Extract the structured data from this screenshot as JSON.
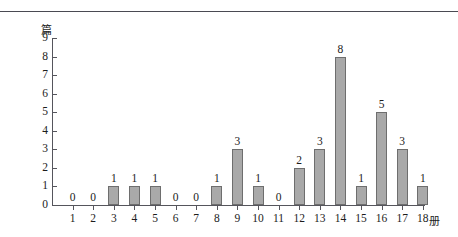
{
  "figure": {
    "top_rule": true,
    "y_unit": "篇",
    "x_unit": "册"
  },
  "chart_data": {
    "type": "bar",
    "title": "",
    "subtitle": "",
    "xlabel": "册",
    "ylabel": "篇",
    "categories": [
      "1",
      "2",
      "3",
      "4",
      "5",
      "6",
      "7",
      "8",
      "9",
      "10",
      "11",
      "12",
      "13",
      "14",
      "15",
      "16",
      "17",
      "18"
    ],
    "values": [
      0,
      0,
      1,
      1,
      1,
      0,
      0,
      1,
      3,
      1,
      0,
      2,
      3,
      8,
      1,
      5,
      3,
      1
    ],
    "data_labels": [
      "0",
      "0",
      "1",
      "1",
      "1",
      "0",
      "0",
      "1",
      "3",
      "1",
      "0",
      "2",
      "3",
      "8",
      "1",
      "5",
      "3",
      "1"
    ],
    "ylim": [
      0,
      9
    ],
    "y_ticks": [
      "0",
      "1",
      "2",
      "3",
      "4",
      "5",
      "6",
      "7",
      "8",
      "9"
    ],
    "x_ticks": [
      "1",
      "2",
      "3",
      "4",
      "5",
      "6",
      "7",
      "8",
      "9",
      "10",
      "11",
      "12",
      "13",
      "14",
      "15",
      "16",
      "17",
      "18"
    ],
    "grid": false,
    "legend": null,
    "bar_color": "#a9a9a9",
    "bar_border_color": "#6e6e6e",
    "axis_color": "#55555c",
    "text_color": "#1c1c1c"
  }
}
